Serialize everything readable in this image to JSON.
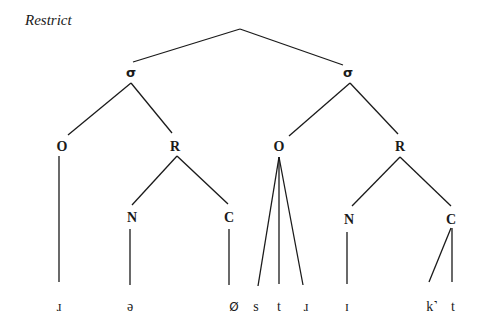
{
  "title": "Restrict",
  "nodes": {
    "root": "",
    "syllable_1": "σ",
    "syllable_2": "σ",
    "onset_1": "O",
    "rhyme_1": "R",
    "nucleus_1": "N",
    "coda_1": "C",
    "onset_2": "O",
    "rhyme_2": "R",
    "nucleus_2": "N",
    "coda_2": "C"
  },
  "segments": [
    {
      "id": "seg-1",
      "symbol": "ɹ",
      "parent": "onset_1"
    },
    {
      "id": "seg-2",
      "symbol": "ə",
      "parent": "nucleus_1"
    },
    {
      "id": "seg-3",
      "symbol": "Ø",
      "parent": "coda_1"
    },
    {
      "id": "seg-4",
      "symbol": "s",
      "parent": "onset_2"
    },
    {
      "id": "seg-5",
      "symbol": "t",
      "parent": "onset_2"
    },
    {
      "id": "seg-6",
      "symbol": "ɹ",
      "parent": "onset_2"
    },
    {
      "id": "seg-7",
      "symbol": "ɪ",
      "parent": "nucleus_2"
    },
    {
      "id": "seg-8",
      "symbol": "k˺",
      "parent": "coda_2"
    },
    {
      "id": "seg-9",
      "symbol": "t",
      "parent": "coda_2"
    }
  ]
}
